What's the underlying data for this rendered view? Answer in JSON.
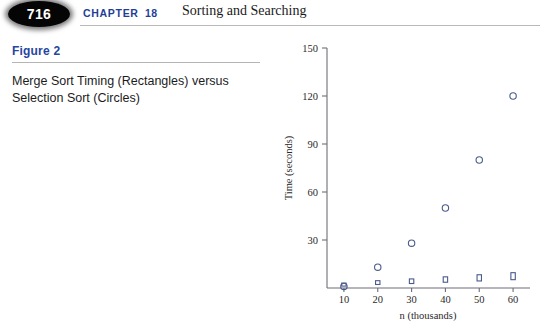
{
  "header": {
    "page_number": "716",
    "chapter_word": "CHAPTER",
    "chapter_number": "18",
    "chapter_title": "Sorting and Searching",
    "accent_color": "#1f3f96"
  },
  "figure": {
    "label": "Figure 2",
    "caption": "Merge Sort Timing (Rectangles) versus Selection Sort (Circles)",
    "label_color": "#2546a0"
  },
  "chart_data": {
    "type": "scatter",
    "title": "",
    "xlabel": "n (thousands)",
    "ylabel": "Time (seconds)",
    "xlim": [
      5,
      65
    ],
    "ylim": [
      0,
      150
    ],
    "xticks": [
      10,
      20,
      30,
      40,
      50,
      60
    ],
    "xtick_labels": [
      "10",
      "20",
      "30",
      "40",
      "50",
      "60"
    ],
    "yticks": [
      30,
      60,
      90,
      120,
      150
    ],
    "ytick_labels": [
      "30",
      "60",
      "90",
      "120",
      "150"
    ],
    "grid": false,
    "legend": "none",
    "marker_color": "#4a5a8c",
    "series": [
      {
        "name": "Selection Sort (Circles)",
        "marker": "circle",
        "x": [
          10,
          20,
          30,
          40,
          50,
          60
        ],
        "values": [
          1,
          13,
          28,
          50,
          80,
          120
        ]
      },
      {
        "name": "Merge Sort (Rectangles)",
        "marker": "rectangle",
        "x": [
          10,
          20,
          30,
          40,
          50,
          60
        ],
        "values": [
          1.2,
          2.2,
          2.8,
          3.6,
          4.4,
          5.2
        ]
      }
    ]
  }
}
